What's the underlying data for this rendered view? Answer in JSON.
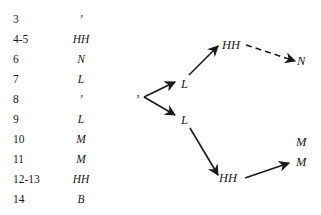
{
  "table": {
    "rows": [
      {
        "index": "3",
        "tone": "’"
      },
      {
        "index": "4-5",
        "tone": "HH"
      },
      {
        "index": "6",
        "tone": "N"
      },
      {
        "index": "7",
        "tone": "L"
      },
      {
        "index": "8",
        "tone": "’"
      },
      {
        "index": "9",
        "tone": "L"
      },
      {
        "index": "10",
        "tone": "M"
      },
      {
        "index": "11",
        "tone": "M"
      },
      {
        "index": "12-13",
        "tone": "HH"
      },
      {
        "index": "14",
        "tone": "B"
      }
    ]
  },
  "diagram": {
    "nodes": {
      "root": "’",
      "upper_l": "L",
      "upper_hh": "HH",
      "upper_n": "N",
      "lower_l": "L",
      "lower_hh": "HH",
      "lower_m1": "M",
      "lower_m2": "M"
    },
    "edges": [
      {
        "from": "root",
        "to": "upper_l",
        "style": "solid"
      },
      {
        "from": "upper_l",
        "to": "upper_hh",
        "style": "solid"
      },
      {
        "from": "upper_hh",
        "to": "upper_n",
        "style": "dashed"
      },
      {
        "from": "root",
        "to": "lower_l",
        "style": "solid"
      },
      {
        "from": "lower_l",
        "to": "lower_hh",
        "style": "solid"
      },
      {
        "from": "lower_hh",
        "to": "lower_m2",
        "style": "solid"
      }
    ]
  }
}
